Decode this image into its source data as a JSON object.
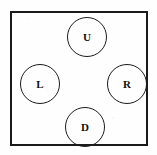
{
  "diagram": {
    "frame": {
      "shape": "rectangle",
      "stroke_color": "#1a1a1a"
    },
    "buttons": [
      {
        "id": "up",
        "label": "U",
        "name": "up-button",
        "position": "top"
      },
      {
        "id": "left",
        "label": "L",
        "name": "left-button",
        "position": "left"
      },
      {
        "id": "right",
        "label": "R",
        "name": "right-button",
        "position": "right"
      },
      {
        "id": "down",
        "label": "D",
        "name": "down-button",
        "position": "bottom"
      }
    ],
    "colors": {
      "background": "#fefefe",
      "ink": "#1a1a1a"
    }
  }
}
